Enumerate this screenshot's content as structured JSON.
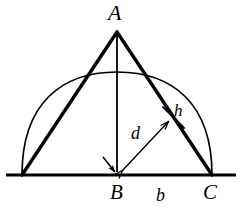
{
  "figure": {
    "type": "geometry-diagram",
    "background_color": "#ffffff",
    "stroke_color": "#000000"
  },
  "labels": {
    "apex": "A",
    "base_left_foot": "B",
    "base_segment": "b",
    "base_right": "C",
    "distance": "d",
    "height_segment": "h"
  },
  "geometry": {
    "points": {
      "A": [
        117,
        32
      ],
      "B": [
        117,
        175
      ],
      "C": [
        212,
        175
      ],
      "left_vertex": [
        22,
        175
      ],
      "foot_on_AC": [
        172,
        118
      ]
    },
    "baseline": {
      "x_start": 6,
      "x_end": 236,
      "y": 175,
      "stroke_width": 3
    },
    "arc": {
      "left_end": [
        22,
        175
      ],
      "right_end": [
        212,
        175
      ],
      "apex_y": 72,
      "stroke_width": 1.6
    },
    "triangle_sides": {
      "left_side": [
        [
          22,
          175
        ],
        [
          117,
          32
        ]
      ],
      "right_side": [
        [
          117,
          32
        ],
        [
          212,
          175
        ]
      ],
      "stroke_width": 3.4
    },
    "altitude": {
      "from": [
        117,
        32
      ],
      "to": [
        117,
        175
      ],
      "stroke_width": 1.8,
      "arrowhead": "down-at-B"
    },
    "d_arrow": {
      "from": [
        117,
        175
      ],
      "to": [
        172,
        118
      ],
      "stroke_width": 1.4,
      "arrowheads": "both"
    },
    "h_tick": {
      "center": [
        172,
        118
      ],
      "length": 22,
      "perpendicular_to": "AC",
      "stroke_width": 1.8
    }
  }
}
